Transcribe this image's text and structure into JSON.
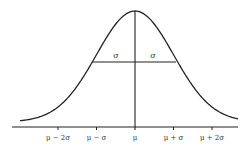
{
  "chart_data": {
    "type": "line",
    "title": "",
    "xlabel": "",
    "ylabel": "",
    "x_ticks": [
      "μ − 2σ",
      "μ − σ",
      "μ",
      "μ + σ",
      "μ + 2σ"
    ],
    "x_tick_values": [
      -2,
      -1,
      0,
      1,
      2
    ],
    "xlim": [
      -3.0,
      2.7
    ],
    "annotations": [
      {
        "text": "σ",
        "position": "left half-width segment",
        "x": -0.5
      },
      {
        "text": "σ",
        "position": "right half-width segment",
        "x": 0.5
      }
    ],
    "mean_line": {
      "x": 0
    },
    "width_line": {
      "x_from": -1.1,
      "x_to": 1.1,
      "label": "σ | σ"
    },
    "grid": false,
    "legend": null
  },
  "colors": {
    "line": "#222222",
    "background": "#ffffff",
    "text": "#333333"
  }
}
